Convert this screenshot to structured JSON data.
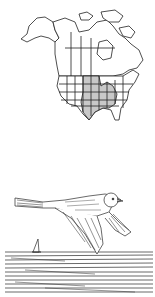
{
  "range_map": {
    "subject": "North America range map",
    "shaded_region": "central United States (Great Plains to Midwest, south to Texas)",
    "colors": {
      "outline": "#222222",
      "shade": "#c8c8c8",
      "background": "#ffffff"
    }
  },
  "illustration": {
    "subject": "sparrow in flight over water with sailboat",
    "style": "pen-and-ink line drawing",
    "colors": {
      "ink": "#2a2a2a",
      "background": "#ffffff"
    }
  }
}
